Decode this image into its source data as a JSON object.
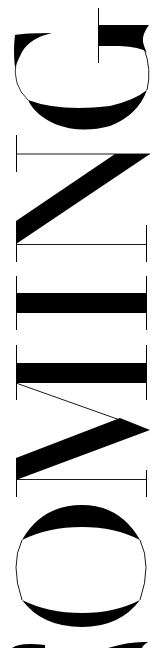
{
  "word": "COMING",
  "orientation": "rotated -90deg, reading bottom-to-top",
  "letters": [
    "C",
    "O",
    "M",
    "I",
    "N",
    "G"
  ],
  "colors": {
    "ink": "#000000",
    "background": "#ffffff"
  }
}
